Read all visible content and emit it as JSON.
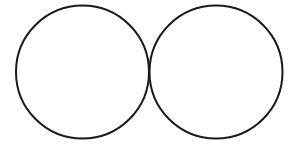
{
  "canvas": {
    "width": 289,
    "height": 150,
    "background_color": "#ffffff",
    "description": "Line drawing of two equal externally tangent circles side by side"
  },
  "style": {
    "stroke_color": "#1a1a1a",
    "stroke_width": 2,
    "fill": "none"
  },
  "figure": {
    "shape_count": 2,
    "tangent_point": {
      "x": 149,
      "y": 72
    },
    "shapes": [
      {
        "id": "circle-left",
        "name": "left-circle",
        "type": "circle",
        "cx": 82.5,
        "cy": 72,
        "r": 66.5,
        "stroke_color": "#1a1a1a",
        "stroke_width": 2,
        "fill": "none",
        "label": ""
      },
      {
        "id": "circle-right",
        "name": "right-circle",
        "type": "circle",
        "cx": 216,
        "cy": 72,
        "r": 66.5,
        "stroke_color": "#1a1a1a",
        "stroke_width": 2,
        "fill": "none",
        "label": ""
      }
    ]
  }
}
